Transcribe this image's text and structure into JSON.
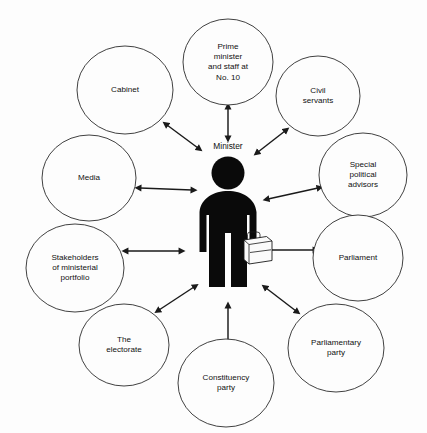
{
  "diagram": {
    "type": "hub-and-spoke relationship diagram",
    "title": "",
    "background_color": "#fdfdfd",
    "node_fill": "#fdfdfd",
    "node_stroke": "#2b2b2b",
    "arrow_color": "#1a1a1a",
    "figure_color": "#0a0a0a",
    "briefcase_color": "#fafafa",
    "center": {
      "label": "Minister",
      "icon": "minister-figure-with-briefcase",
      "cx": 228,
      "cy": 230,
      "label_x": 228,
      "label_y": 147
    },
    "arrow_style": "double-headed",
    "nodes": [
      {
        "id": "prime-minister",
        "lines": [
          "Prime",
          "minister",
          "and staff at",
          "No. 10"
        ],
        "cx": 228,
        "cy": 62,
        "rx": 45,
        "ry": 43,
        "arrow": {
          "x1": 228,
          "y1": 108,
          "x2": 228,
          "y2": 137
        }
      },
      {
        "id": "cabinet",
        "lines": [
          "Cabinet"
        ],
        "cx": 125,
        "cy": 90,
        "rx": 48,
        "ry": 44,
        "arrow": {
          "x1": 167,
          "y1": 125,
          "x2": 198,
          "y2": 148
        }
      },
      {
        "id": "civil-servants",
        "lines": [
          "Civil",
          "servants"
        ],
        "cx": 318,
        "cy": 96,
        "rx": 42,
        "ry": 40,
        "arrow": {
          "x1": 285,
          "y1": 131,
          "x2": 258,
          "y2": 152
        }
      },
      {
        "id": "media",
        "lines": [
          "Media"
        ],
        "cx": 89,
        "cy": 178,
        "rx": 47,
        "ry": 43,
        "arrow": {
          "x1": 140,
          "y1": 188,
          "x2": 192,
          "y2": 190
        }
      },
      {
        "id": "special-political-advisors",
        "lines": [
          "Special",
          "political",
          "advisors"
        ],
        "cx": 363,
        "cy": 175,
        "rx": 44,
        "ry": 42,
        "arrow": {
          "x1": 318,
          "y1": 188,
          "x2": 268,
          "y2": 199
        }
      },
      {
        "id": "stakeholders",
        "lines": [
          "Stakeholders",
          "of ministerial",
          "portfolio"
        ],
        "cx": 75,
        "cy": 268,
        "rx": 49,
        "ry": 44,
        "arrow": {
          "x1": 127,
          "y1": 251,
          "x2": 180,
          "y2": 251
        }
      },
      {
        "id": "parliament",
        "lines": [
          "Parliament"
        ],
        "cx": 358,
        "cy": 258,
        "rx": 45,
        "ry": 43,
        "arrow": {
          "x1": 314,
          "y1": 250,
          "x2": 268,
          "y2": 250
        }
      },
      {
        "id": "the-electorate",
        "lines": [
          "The",
          "electorate"
        ],
        "cx": 124,
        "cy": 345,
        "rx": 45,
        "ry": 41,
        "arrow": {
          "x1": 159,
          "y1": 310,
          "x2": 194,
          "y2": 287
        }
      },
      {
        "id": "parliamentary-party",
        "lines": [
          "Parliamentary",
          "party"
        ],
        "cx": 336,
        "cy": 348,
        "rx": 48,
        "ry": 44,
        "arrow": {
          "x1": 296,
          "y1": 311,
          "x2": 266,
          "y2": 288
        }
      },
      {
        "id": "constituency-party",
        "lines": [
          "Constituency",
          "party"
        ],
        "cx": 226,
        "cy": 383,
        "rx": 48,
        "ry": 44,
        "arrow": {
          "x1": 228,
          "y1": 343,
          "x2": 228,
          "y2": 307
        }
      }
    ]
  }
}
